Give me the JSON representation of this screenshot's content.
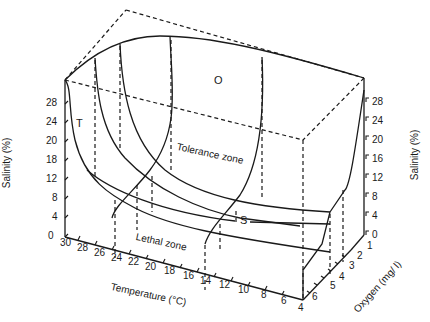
{
  "diagram": {
    "zone_labels": {
      "tolerance": "Tolerance zone",
      "lethal": "Lethal zone",
      "T": "T",
      "O": "O",
      "S": "S"
    },
    "axes": {
      "salinity_left": {
        "title": "Salinity (%)",
        "ticks": [
          "0",
          "4",
          "8",
          "12",
          "18",
          "20",
          "24",
          "28"
        ]
      },
      "salinity_right": {
        "title": "Salinity (%)",
        "ticks": [
          "0",
          "4",
          "8",
          "12",
          "16",
          "20",
          "24",
          "28"
        ]
      },
      "temperature": {
        "title": "Temperature (°C)",
        "ticks": [
          "30",
          "28",
          "26",
          "24",
          "22",
          "20",
          "18",
          "16",
          "14",
          "12",
          "10",
          "8",
          "6",
          "4"
        ]
      },
      "oxygen": {
        "title": "Oxygen (mg/ l)",
        "ticks": [
          "6",
          "5",
          "4",
          "3",
          "2",
          "1",
          "0"
        ]
      }
    },
    "colors": {
      "ink": "#1a1a1a",
      "background": "#ffffff"
    }
  }
}
